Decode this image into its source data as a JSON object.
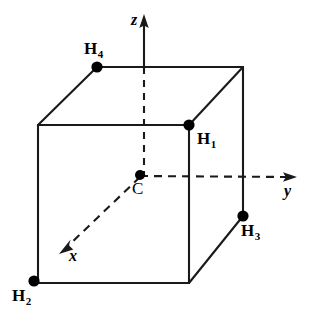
{
  "figure": {
    "type": "3d-geometry-diagram",
    "width": 309,
    "height": 327,
    "background_color": "#ffffff",
    "line_color": "#1a1a1a",
    "dot_color": "#000000"
  },
  "axes": [
    {
      "id": "z",
      "label": "z",
      "style": "solid-with-dashed-interior",
      "arrow": "up",
      "label_x": 131,
      "label_y": 12
    },
    {
      "id": "y",
      "label": "y",
      "style": "dashed",
      "arrow": "right",
      "label_x": 284,
      "label_y": 183
    },
    {
      "id": "x",
      "label": "x",
      "style": "dashed",
      "arrow": "down-left",
      "label_x": 69,
      "label_y": 248
    }
  ],
  "atoms": [
    {
      "id": "H1",
      "label": "H",
      "subscript": "1",
      "dot_x": 189,
      "dot_y": 125,
      "label_x": 197,
      "label_y": 130
    },
    {
      "id": "H2",
      "label": "H",
      "subscript": "2",
      "dot_x": 34,
      "dot_y": 281,
      "label_x": 12,
      "label_y": 287
    },
    {
      "id": "H3",
      "label": "H",
      "subscript": "3",
      "dot_x": 243,
      "dot_y": 216,
      "label_x": 241,
      "label_y": 222
    },
    {
      "id": "H4",
      "label": "H",
      "subscript": "4",
      "dot_x": 97,
      "dot_y": 67,
      "label_x": 84,
      "label_y": 40
    },
    {
      "id": "C",
      "label": "C",
      "subscript": "",
      "dot_x": 140,
      "dot_y": 175,
      "label_x": 132,
      "label_y": 180
    }
  ],
  "cube": {
    "front_face": [
      [
        38,
        125
      ],
      [
        189,
        125
      ],
      [
        189,
        283
      ],
      [
        38,
        283
      ]
    ],
    "back_face": [
      [
        97,
        67
      ],
      [
        243,
        67
      ],
      [
        243,
        216
      ],
      [
        97,
        216
      ]
    ],
    "visible_connectors": [
      [
        [
          38,
          125
        ],
        [
          97,
          67
        ]
      ],
      [
        [
          189,
          125
        ],
        [
          243,
          67
        ]
      ],
      [
        [
          189,
          283
        ],
        [
          243,
          216
        ]
      ]
    ],
    "hidden_connectors": [
      [
        [
          38,
          283
        ],
        [
          97,
          216
        ]
      ]
    ]
  }
}
